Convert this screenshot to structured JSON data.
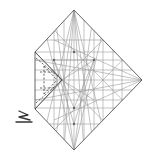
{
  "diagram": {
    "type": "origami-crease-pattern",
    "colors": {
      "background": "#ffffff",
      "crease": "#9a9a9a",
      "edge": "#555555",
      "fold": "#444444",
      "symbol": "#333333"
    },
    "outline": [
      [
        74,
        10
      ],
      [
        142,
        80
      ],
      [
        74,
        150
      ],
      [
        35,
        109
      ],
      [
        35,
        52
      ]
    ],
    "folded_flap": {
      "solid": [
        [
          35,
          52
        ],
        [
          62,
          80
        ],
        [
          35,
          109
        ]
      ],
      "dashed": [
        [
          [
            36,
            58
          ],
          [
            62,
            80
          ]
        ],
        [
          [
            36,
            103
          ],
          [
            62,
            80
          ]
        ],
        [
          [
            44,
            66
          ],
          [
            57,
            80
          ]
        ],
        [
          [
            44,
            94
          ],
          [
            57,
            80
          ]
        ],
        [
          [
            44,
            66
          ],
          [
            44,
            94
          ]
        ],
        [
          [
            40,
            72
          ],
          [
            55,
            72
          ]
        ],
        [
          [
            40,
            88
          ],
          [
            55,
            88
          ]
        ]
      ]
    },
    "nodes": [
      [
        74,
        52
      ],
      [
        54,
        60
      ],
      [
        94,
        60
      ],
      [
        74,
        108
      ],
      [
        74,
        124
      ],
      [
        62,
        80
      ]
    ],
    "symbols": [
      {
        "name": "zigzag-pleat-symbol",
        "label": "pleat fold",
        "points": [
          [
            18,
            113
          ],
          [
            27,
            117
          ],
          [
            19,
            117
          ],
          [
            30,
            121
          ]
        ],
        "base": [
          [
            16,
            122
          ],
          [
            32,
            122
          ]
        ]
      }
    ]
  }
}
